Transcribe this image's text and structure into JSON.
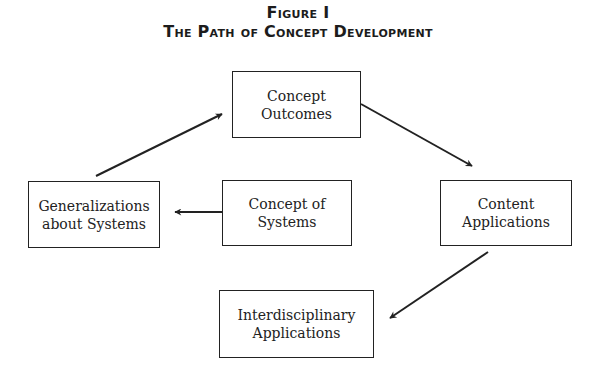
{
  "figure": {
    "label": "Figure I",
    "title": "The Path of Concept Development"
  },
  "nodes": [
    {
      "id": "concept-outcomes",
      "lines": [
        "Concept",
        "Outcomes"
      ]
    },
    {
      "id": "generalizations",
      "lines": [
        "Generalizations",
        "about Systems"
      ]
    },
    {
      "id": "concept-of-systems",
      "lines": [
        "Concept of",
        "Systems"
      ]
    },
    {
      "id": "content-applications",
      "lines": [
        "Content",
        "Applications"
      ]
    },
    {
      "id": "interdisciplinary-applications",
      "lines": [
        "Interdisciplinary",
        "Applications"
      ]
    }
  ],
  "edges": [
    {
      "from": "generalizations",
      "to": "concept-outcomes"
    },
    {
      "from": "concept-outcomes",
      "to": "content-applications"
    },
    {
      "from": "concept-of-systems",
      "to": "generalizations"
    },
    {
      "from": "content-applications",
      "to": "interdisciplinary-applications"
    }
  ],
  "colors": {
    "stroke": "#222222",
    "background": "#ffffff"
  }
}
